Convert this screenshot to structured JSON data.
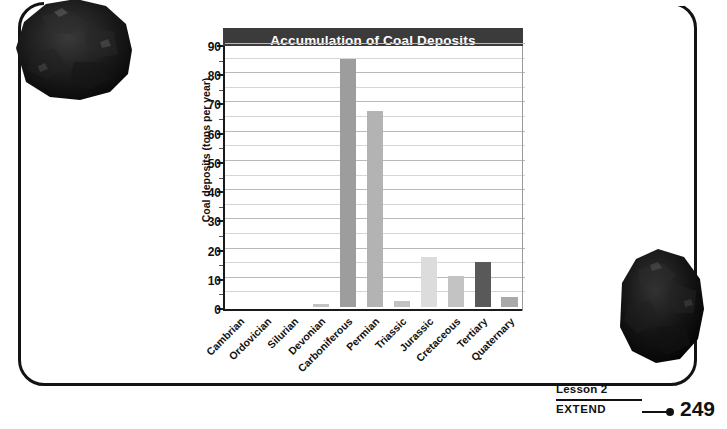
{
  "page": {
    "footer": {
      "lesson_label": "Lesson 2",
      "section_label": "EXTEND",
      "page_number": "249"
    },
    "decorations": [
      {
        "name": "coal-rock-photo-top-left",
        "description": "black coal rock specimen"
      },
      {
        "name": "coal-rock-photo-bottom-right",
        "description": "black coal rock specimen"
      }
    ]
  },
  "chart_data": {
    "type": "bar",
    "title": "Accumulation of Coal Deposits",
    "xlabel": "",
    "ylabel": "Coal deposits (tons per year)",
    "ylim": [
      0,
      90
    ],
    "ytick_step": 10,
    "yminor_step": 5,
    "grid": true,
    "legend": "none",
    "categories": [
      "Cambrian",
      "Ordovician",
      "Silurian",
      "Devonian",
      "Carboniferous",
      "Permian",
      "Triassic",
      "Jurassic",
      "Cretaceous",
      "Tertiary",
      "Quaternary"
    ],
    "values": [
      0,
      0,
      0,
      1,
      85,
      67,
      2,
      17,
      10.5,
      15.5,
      3.5
    ],
    "bar_colors": [
      "#cfcfcf",
      "#cfcfcf",
      "#cfcfcf",
      "#c2c2c2",
      "#9d9d9d",
      "#b3b3b3",
      "#c2c2c2",
      "#dcdcdc",
      "#c3c3c3",
      "#595959",
      "#a9a9a9"
    ],
    "ytick_labels": [
      "0",
      "10",
      "20",
      "30",
      "40",
      "50",
      "60",
      "70",
      "80",
      "90"
    ],
    "title_bar_color": "#3b3b3b",
    "title_text_color": "#ffffff",
    "axis_color": "#1a1a1a",
    "gridline_color": "#b9b9b9"
  }
}
